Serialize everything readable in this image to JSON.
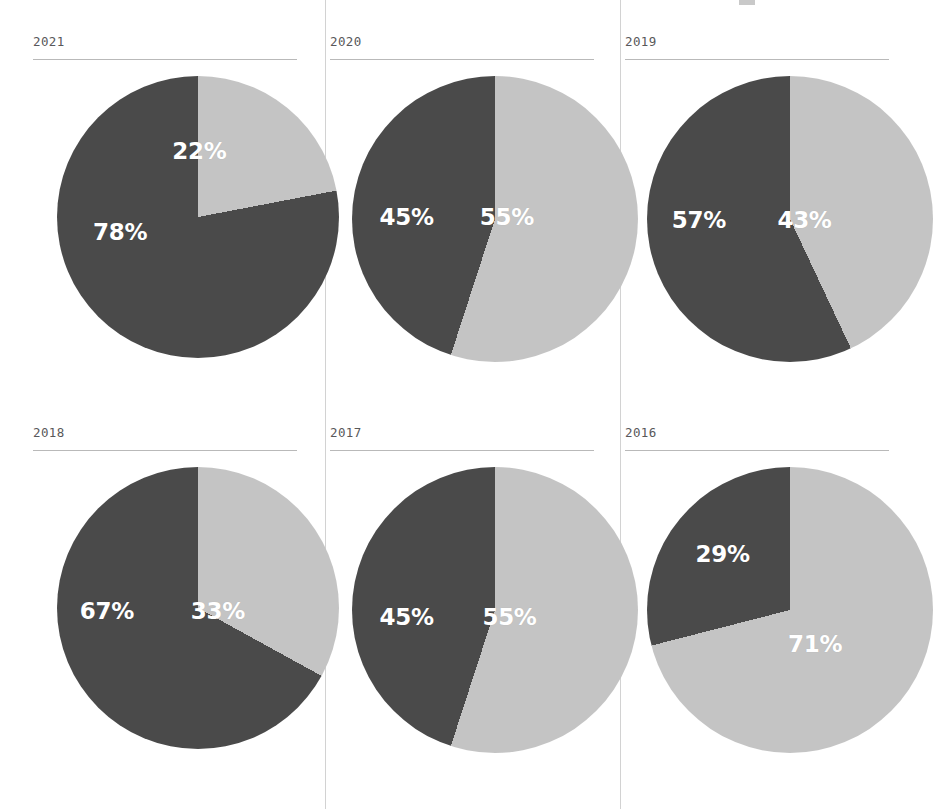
{
  "legend": {
    "swatch_color": "#c9c9c9",
    "label": ""
  },
  "colors": {
    "light": "#c4c4c4",
    "dark": "#4a4a4a",
    "label_text": "#ffffff",
    "year_text": "#58585a",
    "rule": "#b9b9b9",
    "divider": "#d2d2d2",
    "background": "#ffffff"
  },
  "chart_data": {
    "type": "pie",
    "title": "",
    "subtitle": "",
    "xlabel": "",
    "ylabel": "",
    "legend_position": "top-right",
    "grid": false,
    "series_names": [
      "light",
      "dark"
    ],
    "panels": [
      {
        "year": "2021",
        "slices": [
          {
            "name": "light",
            "value": 22,
            "label": "22%",
            "color": "#c4c4c4",
            "start_deg": 0,
            "sweep_deg": 79.2,
            "label_x": 63,
            "label_y": 29
          },
          {
            "name": "dark",
            "value": 78,
            "label": "78%",
            "color": "#4a4a4a",
            "start_deg": 79.2,
            "sweep_deg": 280.8,
            "label_x": 33,
            "label_y": 56
          }
        ]
      },
      {
        "year": "2020",
        "slices": [
          {
            "name": "light",
            "value": 55,
            "label": "55%",
            "color": "#c4c4c4",
            "start_deg": 0,
            "sweep_deg": 198,
            "label_x": 67,
            "label_y": 51
          },
          {
            "name": "dark",
            "value": 45,
            "label": "45%",
            "color": "#4a4a4a",
            "start_deg": 198,
            "sweep_deg": 162,
            "label_x": 29,
            "label_y": 51
          }
        ]
      },
      {
        "year": "2019",
        "slices": [
          {
            "name": "light",
            "value": 43,
            "label": "43%",
            "color": "#c4c4c4",
            "start_deg": 0,
            "sweep_deg": 154.8,
            "label_x": 68,
            "label_y": 52
          },
          {
            "name": "dark",
            "value": 57,
            "label": "57%",
            "color": "#4a4a4a",
            "start_deg": 154.8,
            "sweep_deg": 205.2,
            "label_x": 28,
            "label_y": 52
          }
        ]
      },
      {
        "year": "2018",
        "slices": [
          {
            "name": "light",
            "value": 33,
            "label": "33%",
            "color": "#c4c4c4",
            "start_deg": 0,
            "sweep_deg": 118.8,
            "label_x": 70,
            "label_y": 52
          },
          {
            "name": "dark",
            "value": 67,
            "label": "67%",
            "color": "#4a4a4a",
            "start_deg": 118.8,
            "sweep_deg": 241.2,
            "label_x": 28,
            "label_y": 52
          }
        ]
      },
      {
        "year": "2017",
        "slices": [
          {
            "name": "light",
            "value": 55,
            "label": "55%",
            "color": "#c4c4c4",
            "start_deg": 0,
            "sweep_deg": 198,
            "label_x": 68,
            "label_y": 54
          },
          {
            "name": "dark",
            "value": 45,
            "label": "45%",
            "color": "#4a4a4a",
            "start_deg": 198,
            "sweep_deg": 162,
            "label_x": 29,
            "label_y": 54
          }
        ]
      },
      {
        "year": "2016",
        "slices": [
          {
            "name": "light",
            "value": 71,
            "label": "71%",
            "color": "#c4c4c4",
            "start_deg": 0,
            "sweep_deg": 255.6,
            "label_x": 72,
            "label_y": 63
          },
          {
            "name": "dark",
            "value": 29,
            "label": "29%",
            "color": "#4a4a4a",
            "start_deg": 255.6,
            "sweep_deg": 104.4,
            "label_x": 37,
            "label_y": 33
          }
        ]
      }
    ]
  }
}
